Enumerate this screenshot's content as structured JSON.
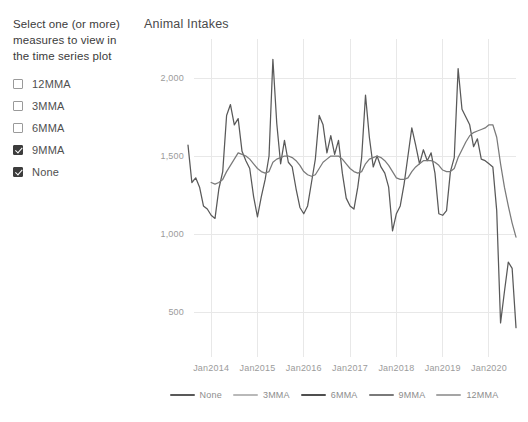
{
  "slicer": {
    "title": "Select one (or more) measures to view in the time series plot",
    "options": [
      {
        "label": "12MMA",
        "checked": false
      },
      {
        "label": "3MMA",
        "checked": false
      },
      {
        "label": "6MMA",
        "checked": false
      },
      {
        "label": "9MMA",
        "checked": true
      },
      {
        "label": "None",
        "checked": true
      }
    ]
  },
  "chart_data": {
    "type": "line",
    "title": "Animal Intakes",
    "xlabel": "",
    "ylabel": "",
    "grid": true,
    "legend_position": "bottom",
    "ylim": [
      250,
      2250
    ],
    "yticks": [
      500,
      1000,
      1500,
      2000
    ],
    "ytick_labels": [
      "500",
      "1,000",
      "1,500",
      "2,000"
    ],
    "xticks": [
      "Jan2014",
      "Jan2015",
      "Jan2016",
      "Jan2017",
      "Jan2018",
      "Jan2019",
      "Jan2020"
    ],
    "xlim": [
      "Jul2013",
      "Sep2020"
    ],
    "legend": [
      {
        "name": "None",
        "color": "#595959"
      },
      {
        "name": "3MMA",
        "color": "#b9b9b9"
      },
      {
        "name": "6MMA",
        "color": "#4f4f4f"
      },
      {
        "name": "9MMA",
        "color": "#7a7a7a"
      },
      {
        "name": "12MMA",
        "color": "#a5a5a5"
      }
    ],
    "x": [
      "Jul2013",
      "Aug2013",
      "Sep2013",
      "Oct2013",
      "Nov2013",
      "Dec2013",
      "Jan2014",
      "Feb2014",
      "Mar2014",
      "Apr2014",
      "May2014",
      "Jun2014",
      "Jul2014",
      "Aug2014",
      "Sep2014",
      "Oct2014",
      "Nov2014",
      "Dec2014",
      "Jan2015",
      "Feb2015",
      "Mar2015",
      "Apr2015",
      "May2015",
      "Jun2015",
      "Jul2015",
      "Aug2015",
      "Sep2015",
      "Oct2015",
      "Nov2015",
      "Dec2015",
      "Jan2016",
      "Feb2016",
      "Mar2016",
      "Apr2016",
      "May2016",
      "Jun2016",
      "Jul2016",
      "Aug2016",
      "Sep2016",
      "Oct2016",
      "Nov2016",
      "Dec2016",
      "Jan2017",
      "Feb2017",
      "Mar2017",
      "Apr2017",
      "May2017",
      "Jun2017",
      "Jul2017",
      "Aug2017",
      "Sep2017",
      "Oct2017",
      "Nov2017",
      "Dec2017",
      "Jan2018",
      "Feb2018",
      "Mar2018",
      "Apr2018",
      "May2018",
      "Jun2018",
      "Jul2018",
      "Aug2018",
      "Sep2018",
      "Oct2018",
      "Nov2018",
      "Dec2018",
      "Jan2019",
      "Feb2019",
      "Mar2019",
      "Apr2019",
      "May2019",
      "Jun2019",
      "Jul2019",
      "Aug2019",
      "Sep2019",
      "Oct2019",
      "Nov2019",
      "Dec2019",
      "Jan2020",
      "Feb2020",
      "Mar2020",
      "Apr2020",
      "May2020",
      "Jun2020",
      "Jul2020",
      "Aug2020"
    ],
    "series": [
      {
        "name": "None",
        "color": "#595959",
        "values": [
          1570,
          1330,
          1360,
          1300,
          1180,
          1160,
          1120,
          1100,
          1290,
          1400,
          1760,
          1830,
          1700,
          1740,
          1530,
          1470,
          1420,
          1240,
          1110,
          1240,
          1350,
          1500,
          2120,
          1710,
          1450,
          1600,
          1460,
          1430,
          1290,
          1170,
          1130,
          1180,
          1330,
          1480,
          1760,
          1700,
          1520,
          1630,
          1510,
          1600,
          1390,
          1230,
          1180,
          1160,
          1300,
          1490,
          1890,
          1620,
          1430,
          1500,
          1430,
          1390,
          1300,
          1020,
          1130,
          1180,
          1320,
          1500,
          1680,
          1570,
          1450,
          1540,
          1470,
          1520,
          1390,
          1130,
          1120,
          1150,
          1400,
          1490,
          2060,
          1800,
          1750,
          1700,
          1560,
          1610,
          1480,
          1470,
          1450,
          1430,
          1150,
          430,
          630,
          820,
          780,
          400
        ]
      },
      {
        "name": "9MMA",
        "color": "#7a7a7a",
        "values": [
          null,
          null,
          null,
          null,
          null,
          null,
          1330,
          1320,
          1330,
          1350,
          1400,
          1440,
          1480,
          1520,
          1510,
          1500,
          1480,
          1450,
          1420,
          1400,
          1390,
          1400,
          1460,
          1480,
          1490,
          1500,
          1500,
          1490,
          1470,
          1440,
          1400,
          1380,
          1370,
          1380,
          1420,
          1460,
          1480,
          1500,
          1500,
          1500,
          1480,
          1450,
          1420,
          1400,
          1390,
          1400,
          1450,
          1480,
          1490,
          1500,
          1490,
          1470,
          1440,
          1400,
          1360,
          1350,
          1350,
          1360,
          1400,
          1430,
          1450,
          1470,
          1470,
          1470,
          1460,
          1440,
          1410,
          1400,
          1400,
          1420,
          1490,
          1540,
          1590,
          1630,
          1650,
          1660,
          1670,
          1680,
          1700,
          1700,
          1620,
          1450,
          1300,
          1180,
          1070,
          980
        ]
      }
    ]
  }
}
